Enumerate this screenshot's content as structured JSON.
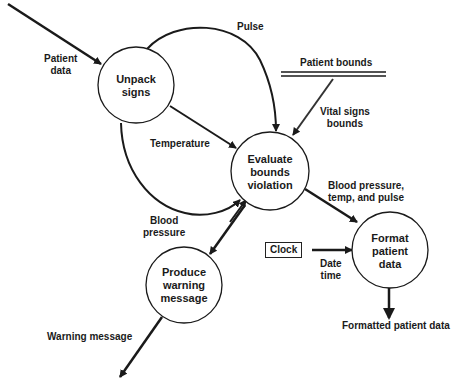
{
  "diagram": {
    "type": "data-flow-diagram",
    "processes": [
      {
        "id": "unpack",
        "label": "Unpack\nsigns",
        "cx": 136,
        "cy": 85,
        "r": 38
      },
      {
        "id": "evaluate",
        "label": "Evaluate\nbounds\nviolation",
        "cx": 270,
        "cy": 171,
        "r": 39
      },
      {
        "id": "format",
        "label": "Format\npatient\ndata",
        "cx": 390,
        "cy": 250,
        "r": 38
      },
      {
        "id": "produce",
        "label": "Produce\nwarning\nmessage",
        "cx": 184,
        "cy": 285,
        "r": 38
      }
    ],
    "data_store": {
      "label": "Patient bounds"
    },
    "external_entity": {
      "label": "Clock"
    },
    "flows": [
      {
        "id": "patient-data",
        "label": "Patient\ndata",
        "from": "external",
        "to": "unpack"
      },
      {
        "id": "pulse",
        "label": "Pulse",
        "from": "unpack",
        "to": "evaluate"
      },
      {
        "id": "temperature",
        "label": "Temperature",
        "from": "unpack",
        "to": "evaluate"
      },
      {
        "id": "blood-pressure",
        "label": "Blood\npressure",
        "from": "unpack",
        "to": "evaluate"
      },
      {
        "id": "vital-signs-bounds",
        "label": "Vital signs\nbounds",
        "from": "patient-bounds",
        "to": "evaluate"
      },
      {
        "id": "bp-temp-pulse",
        "label": "Blood pressure,\ntemp, and pulse",
        "from": "evaluate",
        "to": "format"
      },
      {
        "id": "date-time",
        "label": "Date\ntime",
        "from": "clock",
        "to": "format"
      },
      {
        "id": "formatted-patient-data",
        "label": "Formatted patient data",
        "from": "format",
        "to": "external"
      },
      {
        "id": "warning-message",
        "label": "Warning message",
        "from": "produce",
        "to": "external"
      },
      {
        "id": "evaluate-to-produce",
        "label": "",
        "from": "evaluate",
        "to": "produce"
      }
    ],
    "colors": {
      "stroke": "#1a1a1a",
      "background": "#ffffff",
      "text": "#1a1a1a"
    }
  }
}
